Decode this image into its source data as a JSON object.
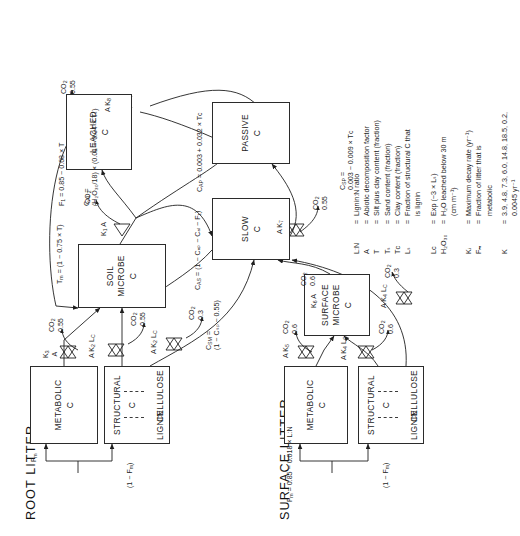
{
  "figure": {
    "title_root": "ROOT LITTER",
    "title_surface": "SURFACE LITTER"
  },
  "pools": {
    "root_metabolic": {
      "name": "METABOLIC",
      "unit": "C"
    },
    "root_structural": {
      "name": "STRUCTURAL",
      "unit": "C",
      "left_part": "LIGNIN",
      "right_part": "CELLULOSE"
    },
    "surface_metabolic": {
      "name": "METABOLIC",
      "unit": "C"
    },
    "surface_structural": {
      "name": "STRUCTURAL",
      "unit": "C",
      "left_part": "LIGNIN",
      "right_part": "CELLULOSE"
    },
    "soil_microbe": {
      "name": "SOIL\nMICROBE",
      "unit": "C"
    },
    "surface_microbe": {
      "name": "SURFACE\nMICROBE",
      "unit": "C"
    },
    "slow": {
      "name": "SLOW",
      "unit": "C"
    },
    "passive": {
      "name": "PASSIVE",
      "unit": "C"
    },
    "leached": {
      "name": "LEACHED",
      "unit": "C"
    }
  },
  "split_labels": {
    "root_metabolic_fraction": "F",
    "root_metabolic_fraction_sub": "m",
    "root_structural_fraction": "(1 − F",
    "root_structural_fraction_sub": "m",
    "root_structural_fraction_end": ")",
    "surface_metabolic_eq": "F",
    "surface_metabolic_eq_sub": "m",
    "surface_metabolic_eq_rest": " = 0.85 − 0.018 × L:N",
    "surface_structural_fraction": "(1 − F",
    "surface_structural_fraction_sub": "m",
    "surface_structural_fraction_end": ")"
  },
  "flow_annotations": {
    "root_metabolic_rate": {
      "k": "K",
      "k_sub": "3",
      "a": "A"
    },
    "root_structural_cellulose_rate": {
      "k": "K",
      "k_sub": "2",
      "a": "A",
      "l": "L",
      "l_sub": "C"
    },
    "root_structural_lignin_rate": {
      "k": "K",
      "k_sub": "2",
      "a": "A",
      "l": "L",
      "l_sub": "C"
    },
    "surface_metabolic_rate": {
      "k": "K",
      "k_sub": "5",
      "a": "A"
    },
    "surface_structural_cellulose_rate": {
      "k": "K",
      "k_sub": "4",
      "a": "A",
      "l": "L",
      "l_sub": "C"
    },
    "surface_structural_lignin_rate": {
      "k": "K",
      "k_sub": "4",
      "a": "A",
      "l": "L",
      "l_sub": "C"
    },
    "soil_microbe_rate": {
      "k": "K",
      "k_sub": "1",
      "a": "A"
    },
    "surface_microbe_rate": {
      "k": "K",
      "k_sub": "6",
      "a": "A"
    },
    "slow_rate": {
      "k": "K",
      "k_sub": "7",
      "a": "A"
    },
    "passive_rate": {
      "k": "K",
      "k_sub": "8",
      "a": "A"
    }
  },
  "co2_fluxes": {
    "root_metabolic": {
      "label": "CO",
      "sub": "2",
      "value": "0.55"
    },
    "root_structural_cellulose": {
      "label": "CO",
      "sub": "2",
      "value": "0.55"
    },
    "root_structural_lignin": {
      "label": "CO",
      "sub": "2",
      "value": "0.3"
    },
    "surface_metabolic": {
      "label": "CO",
      "sub": "2",
      "value": "0.6"
    },
    "surface_structural_cellulose": {
      "label": "CO",
      "sub": "2",
      "value": "0.6"
    },
    "surface_structural_lignin": {
      "label": "CO",
      "sub": "2",
      "value": "0.3"
    },
    "surface_microbe": {
      "label": "CO",
      "sub": "2",
      "value": "0.6"
    },
    "soil_microbe": {
      "label": "CO",
      "sub": "2",
      "value": ""
    },
    "slow": {
      "label": "CO",
      "sub": "2",
      "value": "0.55"
    },
    "passive": {
      "label": "CO",
      "sub": "2",
      "value": "0.55"
    }
  },
  "equations": {
    "tm": "T",
    "tm_sub": "m",
    "tm_rest": " = (1 − 0.75 × T)",
    "f1": "F",
    "f1_sub": "1",
    "f1_rest": " = 0.85 − 0.68 × T",
    "cal": "C",
    "cal_sub": "AL",
    "cal_rest": " =\n(H₂O₃₀/18) × (0.01 + 0.04 × Tₛ)",
    "cas": "C",
    "cas_sub": "AS",
    "cas_rest": " = (1 − Cₐₚ − Cₐₗ − F₁)",
    "cap": "C",
    "cap_sub": "AP",
    "cap_rest": " = 0.003 + 0.032 × Tᴄ",
    "csm": "C",
    "csm_sub": "SM",
    "csm_rest": " =\n(1 − Cₛₚ − 0.55)",
    "csp": "C",
    "csp_sub": "SP",
    "csp_rest": " =\n0.003 − 0.009 × Tᴄ"
  },
  "legend": {
    "rows": [
      {
        "symbol": "L:N",
        "def": "Lignin:N ratio"
      },
      {
        "symbol": "A",
        "def": "Abiotic decomposition factor"
      },
      {
        "symbol": "T",
        "def": "Silt plus clay content (fraction)"
      },
      {
        "symbol": "Tₛ",
        "def": "Sand content (fraction)"
      },
      {
        "symbol": "Tᴄ",
        "def": "Clay content (fraction)"
      },
      {
        "symbol": "Lₛ",
        "def": "Fraction of structural C that\n   is lignin"
      },
      {
        "gap": true
      },
      {
        "symbol": "Lᴄ",
        "def": "Exp (−3 × Lₛ)"
      },
      {
        "symbol": "H₂O₃₀",
        "def": "H₂O leached below 30 m\n   (cm m⁻¹)"
      },
      {
        "gap": true
      },
      {
        "symbol": "Kᵢ",
        "def": "Maximum decay rate (yr⁻¹)"
      },
      {
        "symbol": "Fₘ",
        "def": "Fraction of litter that is\n   metabolic"
      },
      {
        "gap": true
      },
      {
        "symbol": "K",
        "def": "3.9, 4.8, 7.3, 6.0, 14.8, 18.5, 0.2,\n   0.0045 yr⁻¹"
      }
    ]
  }
}
